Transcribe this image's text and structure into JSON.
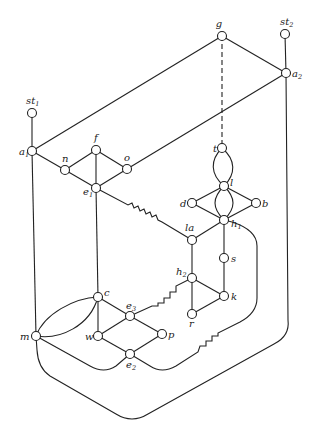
{
  "diagram": {
    "type": "graph",
    "width": 319,
    "height": 447,
    "node_radius": 4.5,
    "colors": {
      "stroke": "#222222",
      "node_fill": "#ffffff",
      "background": "#ffffff"
    },
    "nodes": [
      {
        "id": "g",
        "label": "g",
        "sub": "",
        "x": 222,
        "y": 36,
        "lx": 219,
        "ly": 27,
        "anchor": "middle"
      },
      {
        "id": "st2",
        "label": "st",
        "sub": "2",
        "x": 285,
        "y": 34,
        "lx": 280,
        "ly": 25,
        "anchor": "start"
      },
      {
        "id": "a2",
        "label": "a",
        "sub": "2",
        "x": 286,
        "y": 73,
        "lx": 292,
        "ly": 77,
        "anchor": "start"
      },
      {
        "id": "st1",
        "label": "st",
        "sub": "1",
        "x": 32,
        "y": 113,
        "lx": 26,
        "ly": 104,
        "anchor": "start"
      },
      {
        "id": "a1",
        "label": "a",
        "sub": "1",
        "x": 32,
        "y": 151,
        "lx": 19,
        "ly": 155,
        "anchor": "start"
      },
      {
        "id": "f",
        "label": "f",
        "sub": "",
        "x": 96,
        "y": 150,
        "lx": 94,
        "ly": 141,
        "anchor": "start"
      },
      {
        "id": "n",
        "label": "n",
        "sub": "",
        "x": 65,
        "y": 170,
        "lx": 62,
        "ly": 162,
        "anchor": "start"
      },
      {
        "id": "o",
        "label": "o",
        "sub": "",
        "x": 127,
        "y": 169,
        "lx": 124,
        "ly": 161,
        "anchor": "start"
      },
      {
        "id": "e1",
        "label": "e",
        "sub": "1",
        "x": 96,
        "y": 188,
        "lx": 83,
        "ly": 195,
        "anchor": "start"
      },
      {
        "id": "t",
        "label": "t",
        "sub": "",
        "x": 222,
        "y": 148,
        "lx": 213,
        "ly": 152,
        "anchor": "start"
      },
      {
        "id": "l",
        "label": "l",
        "sub": "",
        "x": 224,
        "y": 186,
        "lx": 230,
        "ly": 186,
        "anchor": "start"
      },
      {
        "id": "d",
        "label": "d",
        "sub": "",
        "x": 192,
        "y": 203,
        "lx": 180,
        "ly": 207,
        "anchor": "start"
      },
      {
        "id": "b",
        "label": "b",
        "sub": "",
        "x": 256,
        "y": 203,
        "lx": 262,
        "ly": 207,
        "anchor": "start"
      },
      {
        "id": "h1",
        "label": "h",
        "sub": "1",
        "x": 224,
        "y": 220,
        "lx": 231,
        "ly": 227,
        "anchor": "start"
      },
      {
        "id": "la",
        "label": "la",
        "sub": "",
        "x": 192,
        "y": 240,
        "lx": 185,
        "ly": 231,
        "anchor": "start"
      },
      {
        "id": "s",
        "label": "s",
        "sub": "",
        "x": 224,
        "y": 258,
        "lx": 231,
        "ly": 262,
        "anchor": "start"
      },
      {
        "id": "h2",
        "label": "h",
        "sub": "2",
        "x": 192,
        "y": 278,
        "lx": 176,
        "ly": 275,
        "anchor": "start"
      },
      {
        "id": "k",
        "label": "k",
        "sub": "",
        "x": 224,
        "y": 296,
        "lx": 231,
        "ly": 300,
        "anchor": "start"
      },
      {
        "id": "r",
        "label": "r",
        "sub": "",
        "x": 192,
        "y": 314,
        "lx": 189,
        "ly": 327,
        "anchor": "start"
      },
      {
        "id": "c",
        "label": "c",
        "sub": "",
        "x": 98,
        "y": 297,
        "lx": 104,
        "ly": 296,
        "anchor": "start"
      },
      {
        "id": "e3",
        "label": "e",
        "sub": "3",
        "x": 130,
        "y": 316,
        "lx": 126,
        "ly": 309,
        "anchor": "start"
      },
      {
        "id": "w",
        "label": "w",
        "sub": "",
        "x": 98,
        "y": 336,
        "lx": 85,
        "ly": 340,
        "anchor": "start"
      },
      {
        "id": "p",
        "label": "p",
        "sub": "",
        "x": 162,
        "y": 334,
        "lx": 168,
        "ly": 338,
        "anchor": "start"
      },
      {
        "id": "e2",
        "label": "e",
        "sub": "2",
        "x": 130,
        "y": 354,
        "lx": 126,
        "ly": 368,
        "anchor": "start"
      },
      {
        "id": "m",
        "label": "m",
        "sub": "",
        "x": 36,
        "y": 336,
        "lx": 20,
        "ly": 340,
        "anchor": "start"
      }
    ],
    "edges": [
      {
        "from": "st1",
        "to": "a1",
        "style": "solid"
      },
      {
        "from": "st2",
        "to": "a2",
        "style": "solid"
      },
      {
        "from": "a1",
        "to": "g",
        "style": "solid"
      },
      {
        "from": "g",
        "to": "a2",
        "style": "solid"
      },
      {
        "from": "a2",
        "to": "o",
        "style": "solid"
      },
      {
        "from": "g",
        "to": "t",
        "style": "dashed"
      },
      {
        "from": "a1",
        "to": "n",
        "style": "solid"
      },
      {
        "from": "n",
        "to": "f",
        "style": "solid"
      },
      {
        "from": "f",
        "to": "o",
        "style": "solid"
      },
      {
        "from": "n",
        "to": "e1",
        "style": "solid"
      },
      {
        "from": "o",
        "to": "e1",
        "style": "solid"
      },
      {
        "from": "f",
        "to": "e1",
        "style": "solid"
      },
      {
        "from": "e1",
        "to": "c",
        "style": "solid"
      },
      {
        "from": "a1",
        "to": "m",
        "style": "solid"
      },
      {
        "from": "e1",
        "to": "la",
        "style": "zigzag"
      },
      {
        "from": "t",
        "to": "l",
        "style": "double-arc"
      },
      {
        "from": "l",
        "to": "h1",
        "style": "double-arc"
      },
      {
        "from": "l",
        "to": "d",
        "style": "solid"
      },
      {
        "from": "l",
        "to": "b",
        "style": "solid"
      },
      {
        "from": "d",
        "to": "h1",
        "style": "solid"
      },
      {
        "from": "b",
        "to": "h1",
        "style": "solid"
      },
      {
        "from": "h1",
        "to": "la",
        "style": "solid"
      },
      {
        "from": "h1",
        "to": "s",
        "style": "solid"
      },
      {
        "from": "s",
        "to": "k",
        "style": "solid"
      },
      {
        "from": "la",
        "to": "h2",
        "style": "solid"
      },
      {
        "from": "h2",
        "to": "k",
        "style": "solid"
      },
      {
        "from": "h2",
        "to": "r",
        "style": "solid"
      },
      {
        "from": "r",
        "to": "k",
        "style": "solid"
      },
      {
        "from": "h2",
        "to": "e3",
        "style": "zigzag"
      },
      {
        "from": "c",
        "to": "e3",
        "style": "solid"
      },
      {
        "from": "c",
        "to": "w",
        "style": "solid"
      },
      {
        "from": "e3",
        "to": "w",
        "style": "solid"
      },
      {
        "from": "e3",
        "to": "p",
        "style": "solid"
      },
      {
        "from": "w",
        "to": "e2",
        "style": "solid"
      },
      {
        "from": "p",
        "to": "e2",
        "style": "solid"
      },
      {
        "from": "m",
        "to": "c",
        "style": "double-arc"
      },
      {
        "from": "m",
        "to": "e2",
        "style": "curve"
      },
      {
        "from": "e2",
        "to": "h1",
        "style": "curve-zigzag"
      },
      {
        "from": "a2",
        "to": "m",
        "style": "outer-curve"
      }
    ]
  }
}
